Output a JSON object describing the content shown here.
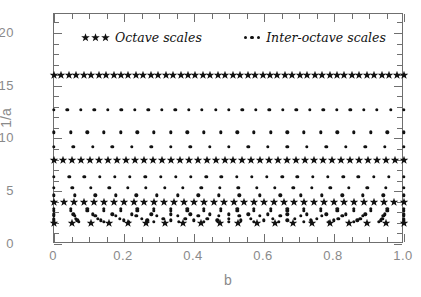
{
  "chart_data": {
    "type": "scatter",
    "title": "",
    "xlabel": "b",
    "ylabel": "1/a",
    "xlim": [
      0.0,
      1.0
    ],
    "ylim": [
      0.0,
      21.8
    ],
    "grid": false,
    "legend_position": "top-inside",
    "xticks": [
      0.0,
      0.2,
      0.4,
      0.6,
      0.8,
      1.0
    ],
    "xticklabels": [
      "0",
      "0.2",
      "0.4",
      "0.6",
      "0.8",
      "1.0"
    ],
    "xminor_step": 0.05,
    "yticks": [
      0,
      5,
      10,
      15,
      20
    ],
    "yticklabels": [
      "0",
      "5",
      "10",
      "15",
      "20"
    ],
    "yminor_step": 1,
    "series": [
      {
        "name": "Octave scales",
        "marker": "star",
        "color": "#111111",
        "rows": [
          {
            "inv_a": 16.0,
            "n_points": 48
          },
          {
            "inv_a": 8.0,
            "n_points": 40
          },
          {
            "inv_a": 4.0,
            "n_points": 36
          },
          {
            "inv_a": 2.0,
            "n_points": 20
          }
        ]
      },
      {
        "name": "Inter-octave scales",
        "marker": "dot",
        "color": "#111111",
        "rows": [
          {
            "inv_a": 12.7,
            "n_points": 27
          },
          {
            "inv_a": 10.6,
            "n_points": 22
          },
          {
            "inv_a": 9.2,
            "n_points": 19
          },
          {
            "inv_a": 6.35,
            "n_points": 24
          },
          {
            "inv_a": 5.3,
            "n_points": 20
          },
          {
            "inv_a": 4.62,
            "n_points": 18
          },
          {
            "inv_a": 3.36,
            "n_points": 22
          },
          {
            "inv_a": 3.17,
            "n_points": 22
          },
          {
            "inv_a": 2.83,
            "n_points": 19
          },
          {
            "inv_a": 2.65,
            "n_points": 18
          },
          {
            "inv_a": 2.38,
            "n_points": 17
          },
          {
            "inv_a": 2.24,
            "n_points": 16
          },
          {
            "inv_a": 2.12,
            "n_points": 15
          }
        ]
      }
    ]
  },
  "axes": {
    "ylabel": "1/a",
    "xlabel": "b",
    "xticklabels": [
      "0",
      "0.2",
      "0.4",
      "0.6",
      "0.8",
      "1.0"
    ],
    "yticklabels": [
      "0",
      "5",
      "10",
      "15",
      "20"
    ]
  },
  "legend": {
    "entries": [
      {
        "label": "Octave scales",
        "marker": "star",
        "marker_count": 3
      },
      {
        "label": "Inter-octave scales",
        "marker": "dot",
        "marker_count": 3
      }
    ]
  },
  "colors": {
    "marker": "#111111",
    "axis": "#6f6f6f",
    "text": "#8a8a8a",
    "background": "#ffffff"
  }
}
